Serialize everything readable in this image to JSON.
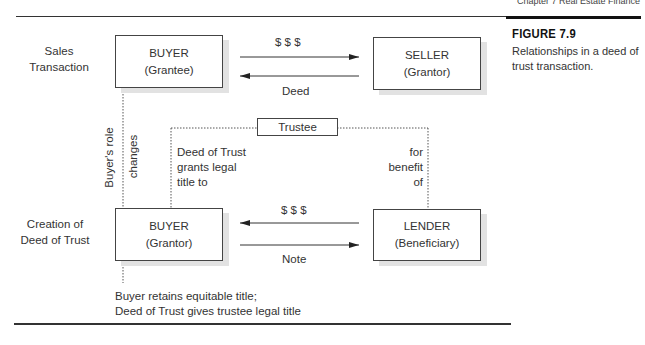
{
  "page": {
    "running_head": "Chapter 7  Real Estate Finance"
  },
  "figure": {
    "title": "FIGURE 7.9",
    "caption": "Relationships in a deed of trust transaction."
  },
  "rows": {
    "sales": {
      "line1": "Sales",
      "line2": "Transaction"
    },
    "creation": {
      "line1": "Creation of",
      "line2": "Deed of Trust"
    }
  },
  "boxes": {
    "buyer_top": {
      "title": "BUYER",
      "role": "(Grantee)"
    },
    "seller": {
      "title": "SELLER",
      "role": "(Grantor)"
    },
    "buyer_bottom": {
      "title": "BUYER",
      "role": "(Grantor)"
    },
    "lender": {
      "title": "LENDER",
      "role": "(Beneficiary)"
    },
    "trustee": {
      "title": "Trustee"
    }
  },
  "arrows": {
    "sales_money": "$ $ $",
    "sales_deed": "Deed",
    "loan_money": "$ $ $",
    "loan_note": "Note"
  },
  "annotations": {
    "role_change_1": "Buyer's role",
    "role_change_2": "changes",
    "dot_grants_1": "Deed of Trust",
    "dot_grants_2": "grants legal",
    "dot_grants_3": "title to",
    "benefit_1": "for",
    "benefit_2": "benefit",
    "benefit_3": "of",
    "footer_1": "Buyer retains equitable title;",
    "footer_2": "Deed of Trust gives trustee legal title"
  }
}
